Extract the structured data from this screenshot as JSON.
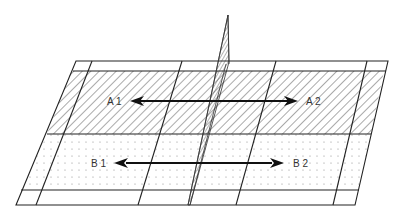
{
  "diagram": {
    "type": "perspective-grid-with-dividing-plane",
    "regions": [
      {
        "id": "A",
        "fill": "diagonal-hatch",
        "labels": [
          "A 1",
          "A 2"
        ]
      },
      {
        "id": "B",
        "fill": "dot-pattern",
        "labels": [
          "B 1",
          "B 2"
        ]
      }
    ],
    "labels": {
      "a1": "A 1",
      "a2": "A 2",
      "b1": "B 1",
      "b2": "B 2"
    },
    "arrows": [
      {
        "from": "A 1",
        "to": "A 2",
        "style": "double-headed"
      },
      {
        "from": "B 1",
        "to": "B 2",
        "style": "double-headed"
      }
    ],
    "colors": {
      "line": "#222222",
      "hatch": "#555555",
      "dot": "#888888",
      "background": "#ffffff"
    }
  }
}
